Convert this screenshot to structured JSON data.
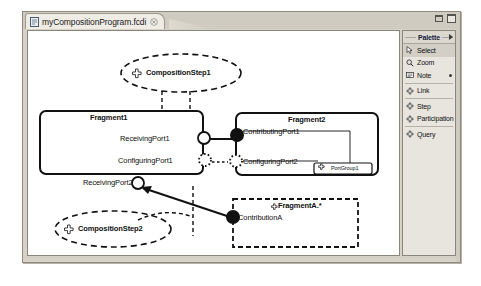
{
  "window": {
    "minimize_icon": "minimize-icon",
    "maximize_icon": "maximize-icon"
  },
  "tab": {
    "label": "myCompositionProgram.fcdi",
    "icon": "file-icon",
    "close_icon": "close-icon"
  },
  "palette": {
    "title": "Palette",
    "collapse_icon": "chevron-right-icon",
    "groups": [
      {
        "items": [
          {
            "label": "Select",
            "icon": "cursor-icon",
            "selected": true
          },
          {
            "label": "Zoom",
            "icon": "magnifier-icon",
            "selected": false
          },
          {
            "label": "Note",
            "icon": "note-icon",
            "selected": false,
            "more": true
          }
        ]
      },
      {
        "items": [
          {
            "label": "Link",
            "icon": "diamond-icon",
            "selected": false
          }
        ]
      },
      {
        "items": [
          {
            "label": "Step",
            "icon": "diamond-icon",
            "selected": false
          },
          {
            "label": "Participation",
            "icon": "diamond-icon",
            "selected": false
          }
        ]
      },
      {
        "items": [
          {
            "label": "Query",
            "icon": "diamond-icon",
            "selected": false
          }
        ]
      }
    ]
  },
  "diagram": {
    "composition_step_1": {
      "label": "CompositionStep1",
      "icon": "diamond-icon"
    },
    "composition_step_2": {
      "label": "CompositionStep2",
      "icon": "diamond-icon"
    },
    "fragment1": {
      "title": "Fragment1",
      "ports": [
        {
          "label": "ReceivingPort1",
          "kind": "hollow-circle"
        },
        {
          "label": "ConfiguringPort1",
          "kind": "dotted-circle"
        },
        {
          "label": "ReceivingPort2",
          "kind": "hollow-circle"
        }
      ]
    },
    "fragment2": {
      "title": "Fragment2",
      "ports": [
        {
          "label": "ContributingPort1",
          "kind": "filled-circle"
        },
        {
          "label": "ConfiguringPort2",
          "kind": "dotted-circle"
        }
      ],
      "port_group": {
        "label": "PortGroup1",
        "icon": "diamond-icon"
      }
    },
    "fragmentA": {
      "title": "FragmentA.*",
      "icon": "diamond-icon",
      "ports": [
        {
          "label": "ContributionA",
          "kind": "filled-circle"
        }
      ]
    }
  },
  "colors": {
    "canvas": "#ffffff",
    "chrome": "#d6d2c8",
    "line": "#111111",
    "palette_title": "#14203c"
  }
}
